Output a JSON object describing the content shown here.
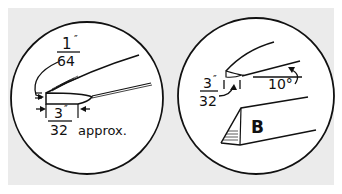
{
  "figure": {
    "background_color": "#ebebeb",
    "line_color": "#111111",
    "left_detail": {
      "top_fraction_numerator": "1",
      "top_fraction_denominator": "64",
      "top_unit": "″",
      "bottom_fraction_numerator": "3",
      "bottom_fraction_denominator": "32",
      "bottom_unit": "″",
      "bottom_suffix": "approx."
    },
    "right_detail": {
      "fraction_numerator": "3",
      "fraction_denominator": "32",
      "fraction_unit": "″",
      "angle": "10°",
      "part_label": "B"
    }
  }
}
